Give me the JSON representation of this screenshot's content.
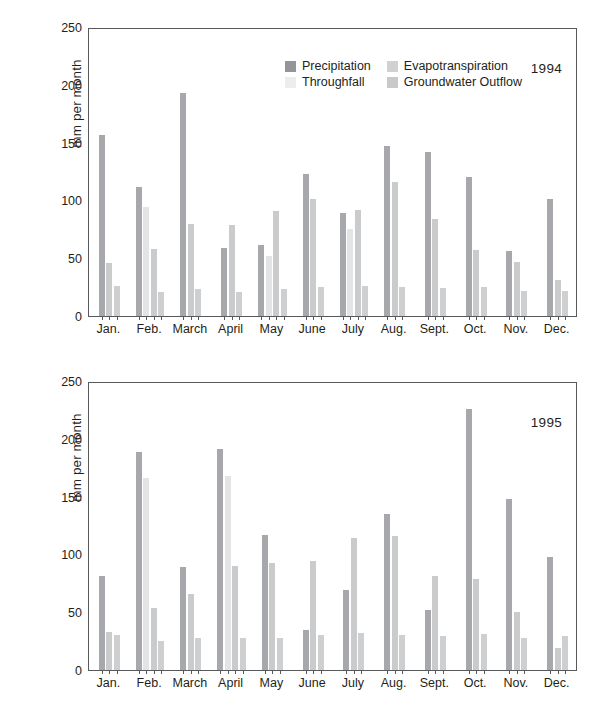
{
  "figure": {
    "caption": ""
  },
  "axis": {
    "ylabel": "mm per month",
    "yticks": [
      "250",
      "200",
      "150",
      "100",
      "50",
      "0"
    ],
    "ymin": 0,
    "ymax": 250
  },
  "legend": {
    "items": [
      {
        "label": "Precipitation",
        "key": "precipitation",
        "color": "#939598"
      },
      {
        "label": "Evapotranspiration",
        "key": "evapotranspiration",
        "color": "#cfd1d3"
      },
      {
        "label": "Throughfall",
        "key": "throughfall",
        "color": "#eceded"
      },
      {
        "label": "Groundwater Outflow",
        "key": "groundwater_outflow",
        "color": "#c7c9cb"
      }
    ]
  },
  "panels": [
    {
      "year": "1994"
    },
    {
      "year": "1995"
    }
  ],
  "chart_data": [
    {
      "type": "bar",
      "title": "1994",
      "xlabel": "",
      "ylabel": "mm per month",
      "ylim": [
        0,
        250
      ],
      "grid": false,
      "legend_position": "top-center",
      "categories": [
        "Jan.",
        "Feb.",
        "March",
        "April",
        "May",
        "June",
        "July",
        "Aug.",
        "Sept.",
        "Oct.",
        "Nov.",
        "Dec."
      ],
      "series": [
        {
          "name": "Precipitation",
          "color": "#a6a8ab",
          "values": [
            157,
            112,
            193,
            59,
            61,
            123,
            89,
            147,
            142,
            120,
            56,
            101
          ]
        },
        {
          "name": "Throughfall",
          "color": "#e3e4e5",
          "values": [
            null,
            94,
            null,
            null,
            52,
            null,
            75,
            null,
            null,
            null,
            null,
            null
          ]
        },
        {
          "name": "Evapotranspiration",
          "color": "#c9cbcd",
          "values": [
            46,
            58,
            80,
            79,
            91,
            101,
            92,
            116,
            84,
            57,
            47,
            31
          ]
        },
        {
          "name": "Groundwater Outflow",
          "color": "#cdcfd1",
          "values": [
            26,
            21,
            23,
            21,
            23,
            25,
            26,
            25,
            24,
            25,
            22,
            22
          ]
        }
      ]
    },
    {
      "type": "bar",
      "title": "1995",
      "xlabel": "",
      "ylabel": "mm per month",
      "ylim": [
        0,
        250
      ],
      "grid": false,
      "legend_position": "none",
      "categories": [
        "Jan.",
        "Feb.",
        "March",
        "April",
        "May",
        "June",
        "July",
        "Aug.",
        "Sept.",
        "Oct.",
        "Nov.",
        "Dec."
      ],
      "series": [
        {
          "name": "Precipitation",
          "color": "#a6a8ab",
          "values": [
            81,
            189,
            89,
            191,
            117,
            35,
            69,
            135,
            52,
            226,
            148,
            98
          ]
        },
        {
          "name": "Throughfall",
          "color": "#e3e4e5",
          "values": [
            null,
            166,
            null,
            168,
            null,
            null,
            null,
            null,
            null,
            null,
            null,
            null
          ]
        },
        {
          "name": "Evapotranspiration",
          "color": "#c9cbcd",
          "values": [
            33,
            54,
            66,
            90,
            93,
            94,
            114,
            116,
            81,
            79,
            50,
            19
          ]
        },
        {
          "name": "Groundwater Outflow",
          "color": "#cdcfd1",
          "values": [
            30,
            25,
            28,
            28,
            28,
            30,
            32,
            30,
            29,
            31,
            28,
            29
          ]
        }
      ]
    }
  ]
}
